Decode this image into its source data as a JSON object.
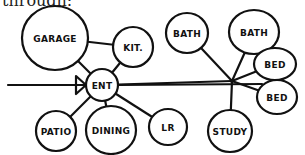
{
  "caption": "through:",
  "diagram": {
    "type": "bubble-adjacency-diagram",
    "colors": {
      "ink": "#111111",
      "background": "#ffffff"
    },
    "nodes": [
      {
        "id": "garage",
        "label": "GARAGE",
        "cx": 55,
        "cy": 38,
        "rx": 33,
        "ry": 32
      },
      {
        "id": "kit",
        "label": "KIT.",
        "cx": 133,
        "cy": 47,
        "rx": 20,
        "ry": 20
      },
      {
        "id": "bath1",
        "label": "BATH",
        "cx": 187,
        "cy": 33,
        "rx": 21,
        "ry": 20
      },
      {
        "id": "bath2",
        "label": "BATH",
        "cx": 254,
        "cy": 32,
        "rx": 25,
        "ry": 22
      },
      {
        "id": "bed1",
        "label": "BED",
        "cx": 275,
        "cy": 64,
        "rx": 21,
        "ry": 16
      },
      {
        "id": "bed2",
        "label": "BED",
        "cx": 277,
        "cy": 97,
        "rx": 20,
        "ry": 17
      },
      {
        "id": "ent",
        "label": "ENT",
        "cx": 102,
        "cy": 85,
        "rx": 16,
        "ry": 16
      },
      {
        "id": "patio",
        "label": "PATIO",
        "cx": 56,
        "cy": 131,
        "rx": 20,
        "ry": 20
      },
      {
        "id": "dining",
        "label": "DINING",
        "cx": 111,
        "cy": 130,
        "rx": 25,
        "ry": 24
      },
      {
        "id": "lr",
        "label": "LR",
        "cx": 168,
        "cy": 127,
        "rx": 19,
        "ry": 18
      },
      {
        "id": "study",
        "label": "STUDY",
        "cx": 230,
        "cy": 131,
        "rx": 22,
        "ry": 21
      }
    ],
    "hub": {
      "x": 232,
      "y": 81
    },
    "entry_arrow": {
      "from_x": 8,
      "to_x": 86,
      "y": 85
    },
    "edges": [
      [
        "garage",
        "kit"
      ],
      [
        "garage",
        "ent"
      ],
      [
        "kit",
        "ent"
      ],
      [
        "ent",
        "patio"
      ],
      [
        "ent",
        "dining"
      ],
      [
        "ent",
        "lr"
      ],
      [
        "ent",
        "hub"
      ],
      [
        "hub",
        "bath1"
      ],
      [
        "hub",
        "bath2"
      ],
      [
        "hub",
        "bed1"
      ],
      [
        "hub",
        "bed2"
      ],
      [
        "hub",
        "study"
      ]
    ]
  }
}
